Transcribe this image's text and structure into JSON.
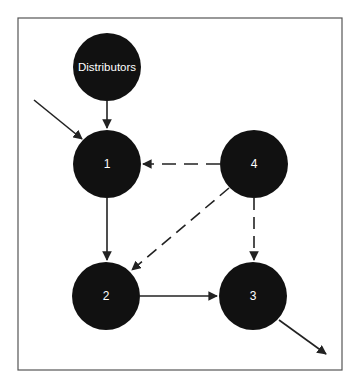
{
  "diagram": {
    "type": "flow-network",
    "frame": {
      "x": 18,
      "y": 18,
      "width": 324,
      "height": 352,
      "stroke": "#555555"
    },
    "node_fill": "#111111",
    "label_color": "#ffffff",
    "edge_color": "#222222",
    "nodes": [
      {
        "id": "distributors",
        "label": "Distributors",
        "cx": 107,
        "cy": 67,
        "r": 34
      },
      {
        "id": "n1",
        "label": "1",
        "cx": 107,
        "cy": 164,
        "r": 34
      },
      {
        "id": "n4",
        "label": "4",
        "cx": 254,
        "cy": 164,
        "r": 34
      },
      {
        "id": "n2",
        "label": "2",
        "cx": 106,
        "cy": 296,
        "r": 34
      },
      {
        "id": "n3",
        "label": "3",
        "cx": 253,
        "cy": 296,
        "r": 34
      }
    ],
    "edges": [
      {
        "from": "distributors",
        "to": "n1",
        "style": "solid"
      },
      {
        "from": "external-in",
        "to": "n1",
        "style": "solid"
      },
      {
        "from": "n4",
        "to": "n1",
        "style": "dashed"
      },
      {
        "from": "n1",
        "to": "n2",
        "style": "solid"
      },
      {
        "from": "n4",
        "to": "n2",
        "style": "dashed"
      },
      {
        "from": "n4",
        "to": "n3",
        "style": "dashed"
      },
      {
        "from": "n2",
        "to": "n3",
        "style": "solid"
      },
      {
        "from": "n3",
        "to": "external-out",
        "style": "solid"
      }
    ]
  }
}
